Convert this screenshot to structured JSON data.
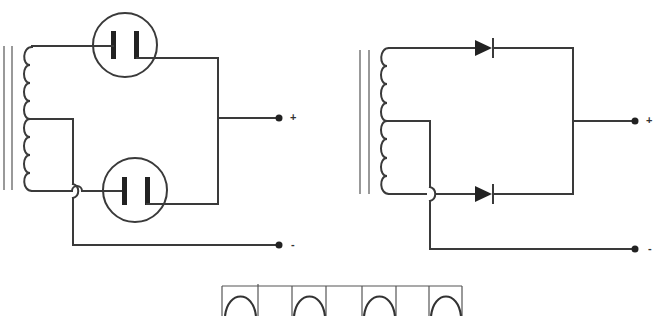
{
  "figure": {
    "type": "full-wave rectifier comparison",
    "left_circuit": {
      "name": "vacuum tube full-wave rectifier",
      "components": [
        "center-tapped transformer",
        "diode tube (top)",
        "diode tube (bottom)"
      ],
      "terminals": {
        "positive": "+",
        "negative": "-"
      }
    },
    "right_circuit": {
      "name": "semiconductor full-wave rectifier",
      "components": [
        "center-tapped transformer",
        "diode (top)",
        "diode (bottom)"
      ],
      "terminals": {
        "positive": "+",
        "negative": "-"
      }
    },
    "waveform": {
      "name": "full-wave rectified output",
      "pulses": 4,
      "divisions": 7
    }
  },
  "colors": {
    "line": "#3a3a3a",
    "background": "#ffffff"
  }
}
